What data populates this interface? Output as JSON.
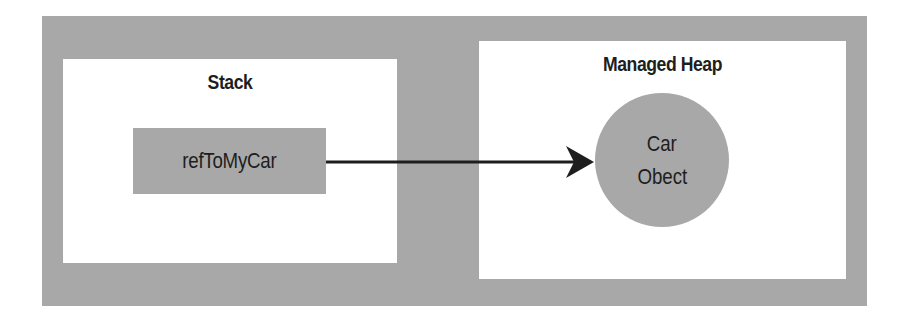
{
  "diagram": {
    "type": "memory-reference",
    "colors": {
      "background": "#ffffff",
      "frame": "#a8a8a8",
      "panel": "#ffffff",
      "text": "#1e1e1e",
      "arrow": "#1e1e1e"
    },
    "stack": {
      "title": "Stack",
      "variable": {
        "label": "refToMyCar"
      }
    },
    "heap": {
      "title": "Managed Heap",
      "object": {
        "line1": "Car",
        "line2": "Obect"
      }
    },
    "edges": [
      {
        "from": "refToMyCar",
        "to": "Car Obect",
        "style": "solid-arrow"
      }
    ]
  }
}
